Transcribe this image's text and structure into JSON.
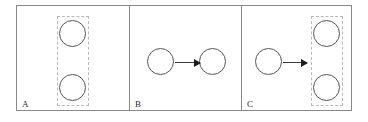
{
  "figure": {
    "type": "diagram",
    "background_color": "#ffffff",
    "frame_color": "#8a8a8a",
    "node_stroke_color": "#55555a",
    "node_fill_color": "#ffffff",
    "dashed_box_color": "#b9b9bd",
    "arrow_color": "#1c1c1c"
  },
  "panels": [
    {
      "id": "A",
      "label": "A",
      "nodes": [
        {
          "name": "node-a-top",
          "label": ""
        },
        {
          "name": "node-a-bottom",
          "label": ""
        }
      ],
      "groups": [
        {
          "name": "group-a",
          "label": "",
          "contains": [
            "node-a-top",
            "node-a-bottom"
          ]
        }
      ],
      "arrows": []
    },
    {
      "id": "B",
      "label": "B",
      "nodes": [
        {
          "name": "node-b-left",
          "label": ""
        },
        {
          "name": "node-b-right",
          "label": ""
        }
      ],
      "groups": [],
      "arrows": [
        {
          "name": "arrow-b",
          "label": "",
          "from": "node-b-left",
          "to": "node-b-right"
        }
      ]
    },
    {
      "id": "C",
      "label": "C",
      "nodes": [
        {
          "name": "node-c-left",
          "label": ""
        },
        {
          "name": "node-c-top",
          "label": ""
        },
        {
          "name": "node-c-bottom",
          "label": ""
        }
      ],
      "groups": [
        {
          "name": "group-c",
          "label": "",
          "contains": [
            "node-c-top",
            "node-c-bottom"
          ]
        }
      ],
      "arrows": [
        {
          "name": "arrow-c",
          "label": "",
          "from": "node-c-left",
          "to": "group-c"
        }
      ]
    }
  ]
}
